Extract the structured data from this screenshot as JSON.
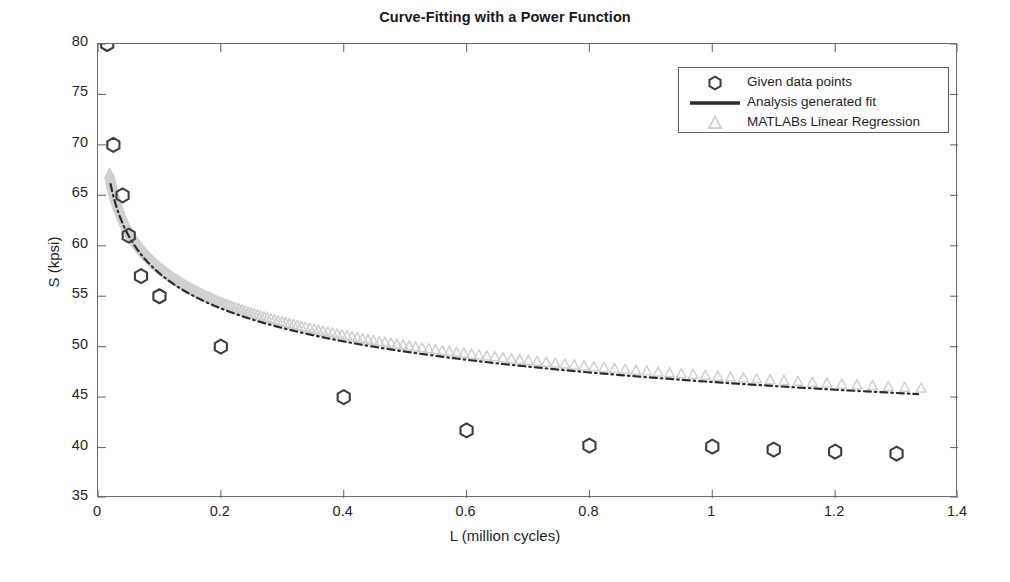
{
  "chart_data": {
    "type": "scatter",
    "title": "Curve-Fitting with a Power Function",
    "xlabel": "L (million cycles)",
    "ylabel": "S (kpsi)",
    "xlim": [
      0,
      1.4
    ],
    "ylim": [
      35,
      80
    ],
    "xticks": [
      0,
      0.2,
      0.4,
      0.6,
      0.8,
      1,
      1.2,
      1.4
    ],
    "xticklabels": [
      "0",
      "0.2",
      "0.4",
      "0.6",
      "0.8",
      "1",
      "1.2",
      "1.4"
    ],
    "yticks": [
      35,
      40,
      45,
      50,
      55,
      60,
      65,
      70,
      75,
      80
    ],
    "yticklabels": [
      "35",
      "40",
      "45",
      "50",
      "55",
      "60",
      "65",
      "70",
      "75",
      "80"
    ],
    "grid": false,
    "legend_position": "upper right",
    "series": [
      {
        "name": "Given data points",
        "type": "scatter",
        "marker": "hexagram",
        "color": "#3d3d3d",
        "x": [
          0.015,
          0.025,
          0.04,
          0.05,
          0.07,
          0.1,
          0.2,
          0.4,
          0.6,
          0.8,
          1.0,
          1.1,
          1.2,
          1.3
        ],
        "y": [
          80.0,
          70.0,
          65.0,
          61.0,
          57.0,
          55.0,
          50.0,
          45.0,
          41.7,
          40.2,
          40.1,
          39.8,
          39.6,
          39.4
        ]
      },
      {
        "name": "Analysis generated fit",
        "type": "line",
        "style": "dashed-dotted",
        "color": "#2b2b2b",
        "model": "power",
        "coefficients": {
          "a": 46.5,
          "b": -0.0905
        },
        "x": [
          0.02,
          0.03,
          0.04,
          0.05,
          0.07,
          0.1,
          0.15,
          0.2,
          0.3,
          0.4,
          0.5,
          0.6,
          0.7,
          0.8,
          0.9,
          1.0,
          1.1,
          1.2,
          1.3
        ],
        "y": [
          72.0,
          68.0,
          65.1,
          62.9,
          59.8,
          56.5,
          52.6,
          50.1,
          46.7,
          44.5,
          42.9,
          41.7,
          40.7,
          39.9,
          39.2,
          38.6,
          38.1,
          37.7,
          37.3
        ]
      },
      {
        "name": "MATLABs Linear Regression",
        "type": "scatter",
        "marker": "triangle",
        "color": "#d0d0d0",
        "model": "power",
        "coefficients": {
          "a": 47.1,
          "b": -0.0895
        },
        "x": [
          0.02,
          0.03,
          0.04,
          0.05,
          0.07,
          0.1,
          0.15,
          0.2,
          0.3,
          0.4,
          0.5,
          0.6,
          0.7,
          0.8,
          0.9,
          1.0,
          1.1,
          1.2,
          1.3
        ],
        "y": [
          73.2,
          69.1,
          66.1,
          63.9,
          60.7,
          57.4,
          53.4,
          50.9,
          47.4,
          45.2,
          43.6,
          42.3,
          41.3,
          40.5,
          39.8,
          39.2,
          38.7,
          38.2,
          37.8
        ]
      }
    ],
    "legend": [
      {
        "label": "Given data points",
        "marker": "hexagram-icon",
        "color": "#3d3d3d"
      },
      {
        "label": "Analysis generated fit",
        "marker": "line-icon",
        "color": "#2b2b2b"
      },
      {
        "label": "MATLABs Linear Regression",
        "marker": "triangle-icon",
        "color": "#d0d0d0"
      }
    ]
  }
}
